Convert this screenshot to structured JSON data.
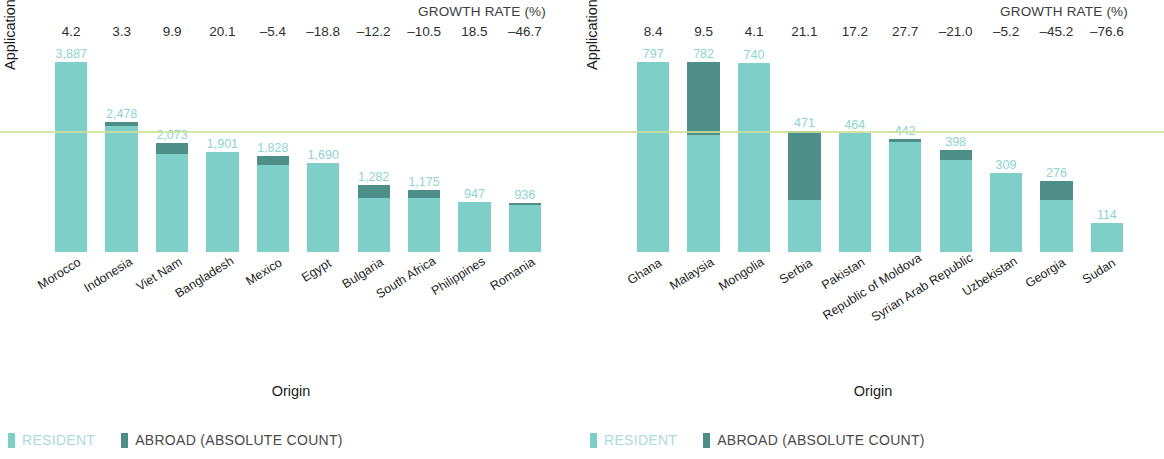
{
  "chart_data": [
    {
      "type": "bar",
      "panel": "left",
      "title": "",
      "xlabel": "Origin",
      "ylabel": "Application design count",
      "growth_header": "GROWTH RATE (%)",
      "ylim": [
        0,
        3887
      ],
      "grid": false,
      "stacked": true,
      "legend": [
        "RESIDENT",
        "ABROAD (ABSOLUTE COUNT)"
      ],
      "legend_position": "bottom-left",
      "categories": [
        "Morocco",
        "Indonesia",
        "Viet Nam",
        "Bangladesh",
        "Mexico",
        "Egypt",
        "Bulgaria",
        "South Africa",
        "Philippines",
        "Romania"
      ],
      "values": [
        3887,
        2478,
        2073,
        1901,
        1828,
        1690,
        1282,
        1175,
        947,
        936
      ],
      "value_labels": [
        "3,887",
        "2,478",
        "2,073",
        "1,901",
        "1,828",
        "1,690",
        "1,282",
        "1,175",
        "947",
        "936"
      ],
      "growth_rates": [
        "4.2",
        "3.3",
        "9.9",
        "20.1",
        "–5.4",
        "–18.8",
        "–12.2",
        "–10.5",
        "18.5",
        "–46.7"
      ],
      "series": [
        {
          "name": "RESIDENT",
          "values": [
            3887,
            2400,
            1870,
            1901,
            1660,
            1690,
            1020,
            1035,
            947,
            900
          ]
        },
        {
          "name": "ABROAD (ABSOLUTE COUNT)",
          "values": [
            0,
            78,
            203,
            0,
            168,
            0,
            262,
            140,
            0,
            36
          ]
        }
      ]
    },
    {
      "type": "bar",
      "panel": "right",
      "title": "",
      "xlabel": "Origin",
      "ylabel": "Application design count",
      "growth_header": "GROWTH RATE (%)",
      "ylim": [
        0,
        797
      ],
      "grid": false,
      "stacked": true,
      "legend": [
        "RESIDENT",
        "ABROAD (ABSOLUTE COUNT)"
      ],
      "legend_position": "bottom-left",
      "categories": [
        "Ghana",
        "Malaysia",
        "Mongolia",
        "Serbia",
        "Pakistan",
        "Republic of Moldova",
        "Syrian Arab Republic",
        "Uzbekistan",
        "Georgia",
        "Sudan"
      ],
      "values": [
        797,
        782,
        740,
        471,
        464,
        442,
        398,
        309,
        276,
        114
      ],
      "value_labels": [
        "797",
        "782",
        "740",
        "471",
        "464",
        "442",
        "398",
        "309",
        "276",
        "114"
      ],
      "growth_rates": [
        "8.4",
        "9.5",
        "4.1",
        "21.1",
        "17.2",
        "27.7",
        "–21.0",
        "–5.2",
        "–45.2",
        "–76.6"
      ],
      "series": [
        {
          "name": "RESIDENT",
          "values": [
            797,
            480,
            740,
            205,
            464,
            430,
            360,
            309,
            205,
            114
          ]
        },
        {
          "name": "ABROAD (ABSOLUTE COUNT)",
          "values": [
            0,
            302,
            0,
            266,
            0,
            12,
            38,
            0,
            71,
            0
          ]
        }
      ]
    }
  ],
  "colors": {
    "resident": "#7ecfc8",
    "abroad": "#4d8e88",
    "value_label": "#8ed4cd",
    "axis_text": "#1c1c1c",
    "legend_resident_text": "#a9dcd7",
    "legend_abroad_text": "#4a4a4a"
  },
  "left": {
    "growth_header": "GROWTH RATE (%)",
    "ylabel": "Application design count",
    "xlabel": "Origin",
    "legend_resident": "RESIDENT",
    "legend_abroad": "ABROAD (ABSOLUTE COUNT)"
  },
  "right": {
    "growth_header": "GROWTH RATE (%)",
    "ylabel": "Application design count",
    "xlabel": "Origin",
    "legend_resident": "RESIDENT",
    "legend_abroad": "ABROAD (ABSOLUTE COUNT)"
  }
}
